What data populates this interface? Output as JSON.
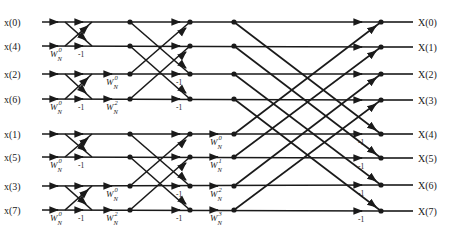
{
  "diagram": {
    "colors": {
      "ink": "#1a1a1a",
      "background": "#ffffff"
    },
    "inputs": [
      "x(0)",
      "x(4)",
      "x(2)",
      "x(6)",
      "x(1)",
      "x(5)",
      "x(3)",
      "x(7)"
    ],
    "outputs": [
      "X(0)",
      "X(1)",
      "X(2)",
      "X(3)",
      "X(4)",
      "X(5)",
      "X(6)",
      "X(7)"
    ],
    "twiddle_base": "W",
    "twiddle_sub": "N",
    "minus_one": "-1",
    "stage1": {
      "twiddles": [
        {
          "row": 1,
          "exp": "0"
        },
        {
          "row": 3,
          "exp": "0"
        },
        {
          "row": 5,
          "exp": "0"
        },
        {
          "row": 7,
          "exp": "0"
        }
      ],
      "minus_one_rows": [
        1,
        3,
        5,
        7
      ]
    },
    "stage2": {
      "twiddles": [
        {
          "row": 2,
          "exp": "0"
        },
        {
          "row": 3,
          "exp": "2"
        },
        {
          "row": 6,
          "exp": "0"
        },
        {
          "row": 7,
          "exp": "2"
        }
      ],
      "minus_one_rows": [
        2,
        3,
        6,
        7
      ]
    },
    "stage3": {
      "twiddles": [
        {
          "row": 4,
          "exp": "0"
        },
        {
          "row": 5,
          "exp": "1"
        },
        {
          "row": 6,
          "exp": "2"
        },
        {
          "row": 7,
          "exp": "3"
        }
      ],
      "minus_one_rows": [
        4,
        5,
        6,
        7
      ]
    }
  }
}
